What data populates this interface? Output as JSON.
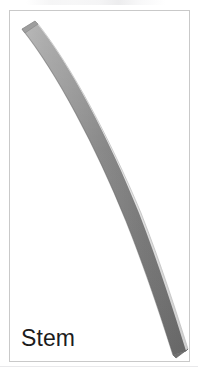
{
  "page": {
    "background_color": "#ffffff",
    "width": 198,
    "height": 373
  },
  "figure_card": {
    "border_color": "#c9c9c9",
    "background_color": "#ffffff",
    "caption": "Stem",
    "caption_color": "#1c1c1c"
  },
  "illustration": {
    "name": "curved-stem",
    "description": "Curved elongated plant stem rendered as a shaded gray band arcing from upper-left to lower-right",
    "core_color": "#8d8d8d",
    "shadow_color": "#6f6f6f",
    "highlight_color": "#e4e4e4",
    "outline_color": "#b6b6b6"
  },
  "top_artifact": {
    "name": "clipped-text-strip",
    "text": ""
  }
}
